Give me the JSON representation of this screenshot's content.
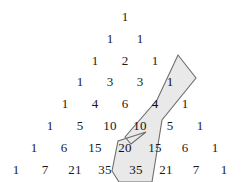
{
  "figure": {
    "colors": {
      "background": "#ffffff",
      "number": "#1a1a1a",
      "highlight_fill": "#e9e9e9",
      "highlight_stroke": "#6e6e6e"
    }
  },
  "chart_data": {
    "type": "table",
    "xlabel": "",
    "ylabel": "",
    "rows": [
      {
        "row_index": 0,
        "values": [
          1
        ]
      },
      {
        "row_index": 1,
        "values": [
          1,
          1
        ]
      },
      {
        "row_index": 2,
        "values": [
          1,
          2,
          1
        ]
      },
      {
        "row_index": 3,
        "values": [
          1,
          3,
          3,
          1
        ]
      },
      {
        "row_index": 4,
        "values": [
          1,
          4,
          6,
          4,
          1
        ]
      },
      {
        "row_index": 5,
        "values": [
          1,
          5,
          10,
          10,
          5,
          1
        ]
      },
      {
        "row_index": 6,
        "values": [
          1,
          6,
          15,
          20,
          15,
          6,
          1
        ]
      },
      {
        "row_index": 7,
        "values": [
          1,
          7,
          21,
          35,
          35,
          21,
          7,
          1
        ]
      }
    ],
    "highlighted_cells": [
      {
        "row": 3,
        "col": 3,
        "value": 1
      },
      {
        "row": 4,
        "col": 3,
        "value": 4
      },
      {
        "row": 5,
        "col": 3,
        "value": 10
      },
      {
        "row": 6,
        "col": 3,
        "value": 20
      },
      {
        "row": 7,
        "col": 4,
        "value": 35
      }
    ],
    "highlight_note": "1 + 4 + 10 + 20 = 35 (hockey stick identity)"
  },
  "cells": [
    {
      "text": "1",
      "x": 125,
      "y": 16,
      "highlighted": false,
      "row": 0,
      "col": 0
    },
    {
      "text": "1",
      "x": 110,
      "y": 38,
      "highlighted": false,
      "row": 1,
      "col": 0
    },
    {
      "text": "1",
      "x": 140,
      "y": 38,
      "highlighted": false,
      "row": 1,
      "col": 1
    },
    {
      "text": "1",
      "x": 95,
      "y": 60,
      "highlighted": false,
      "row": 2,
      "col": 0
    },
    {
      "text": "2",
      "x": 125,
      "y": 60,
      "highlighted": false,
      "row": 2,
      "col": 1
    },
    {
      "text": "1",
      "x": 155,
      "y": 60,
      "highlighted": false,
      "row": 2,
      "col": 2
    },
    {
      "text": "1",
      "x": 80,
      "y": 81,
      "highlighted": false,
      "row": 3,
      "col": 0
    },
    {
      "text": "3",
      "x": 110,
      "y": 81,
      "highlighted": false,
      "row": 3,
      "col": 1
    },
    {
      "text": "3",
      "x": 140,
      "y": 81,
      "highlighted": false,
      "row": 3,
      "col": 2
    },
    {
      "text": "1",
      "x": 170,
      "y": 81,
      "highlighted": true,
      "row": 3,
      "col": 3
    },
    {
      "text": "1",
      "x": 65,
      "y": 103,
      "highlighted": false,
      "row": 4,
      "col": 0
    },
    {
      "text": "4",
      "x": 95,
      "y": 103,
      "highlighted": false,
      "row": 4,
      "col": 1
    },
    {
      "text": "6",
      "x": 125,
      "y": 103,
      "highlighted": false,
      "row": 4,
      "col": 2
    },
    {
      "text": "4",
      "x": 155,
      "y": 103,
      "highlighted": true,
      "row": 4,
      "col": 3
    },
    {
      "text": "1",
      "x": 185,
      "y": 103,
      "highlighted": false,
      "row": 4,
      "col": 4
    },
    {
      "text": "1",
      "x": 50,
      "y": 125,
      "highlighted": false,
      "row": 5,
      "col": 0
    },
    {
      "text": "5",
      "x": 80,
      "y": 125,
      "highlighted": false,
      "row": 5,
      "col": 1
    },
    {
      "text": "10",
      "x": 110,
      "y": 125,
      "highlighted": false,
      "row": 5,
      "col": 2
    },
    {
      "text": "10",
      "x": 140,
      "y": 125,
      "highlighted": true,
      "row": 5,
      "col": 3
    },
    {
      "text": "5",
      "x": 170,
      "y": 125,
      "highlighted": false,
      "row": 5,
      "col": 4
    },
    {
      "text": "1",
      "x": 200,
      "y": 125,
      "highlighted": false,
      "row": 5,
      "col": 5
    },
    {
      "text": "1",
      "x": 34,
      "y": 147,
      "highlighted": false,
      "row": 6,
      "col": 0
    },
    {
      "text": "6",
      "x": 64,
      "y": 147,
      "highlighted": false,
      "row": 6,
      "col": 1
    },
    {
      "text": "15",
      "x": 95,
      "y": 147,
      "highlighted": false,
      "row": 6,
      "col": 2
    },
    {
      "text": "20",
      "x": 125,
      "y": 147,
      "highlighted": true,
      "row": 6,
      "col": 3
    },
    {
      "text": "15",
      "x": 155,
      "y": 147,
      "highlighted": false,
      "row": 6,
      "col": 4
    },
    {
      "text": "6",
      "x": 185,
      "y": 147,
      "highlighted": false,
      "row": 6,
      "col": 5
    },
    {
      "text": "1",
      "x": 215,
      "y": 147,
      "highlighted": false,
      "row": 6,
      "col": 6
    },
    {
      "text": "1",
      "x": 16,
      "y": 169,
      "highlighted": false,
      "row": 7,
      "col": 0
    },
    {
      "text": "7",
      "x": 45,
      "y": 169,
      "highlighted": false,
      "row": 7,
      "col": 1
    },
    {
      "text": "21",
      "x": 75,
      "y": 169,
      "highlighted": false,
      "row": 7,
      "col": 2
    },
    {
      "text": "35",
      "x": 105,
      "y": 169,
      "highlighted": false,
      "row": 7,
      "col": 3
    },
    {
      "text": "35",
      "x": 136,
      "y": 169,
      "highlighted": true,
      "row": 7,
      "col": 4
    },
    {
      "text": "21",
      "x": 166,
      "y": 169,
      "highlighted": false,
      "row": 7,
      "col": 5
    },
    {
      "text": "7",
      "x": 196,
      "y": 169,
      "highlighted": false,
      "row": 7,
      "col": 6
    },
    {
      "text": "1",
      "x": 224,
      "y": 169,
      "highlighted": false,
      "row": 7,
      "col": 7
    }
  ],
  "highlight_shape": {
    "points": "178,55 195,78 163,117 157,160 149,182 120,182 113,172 117,141 145,131 134,144 128,138 158,101",
    "path": "M 178 55 L 196 78 L 161 122 L 152 182 L 119 182 L 112 171 L 118 140 L 146 132 L 131 143 L 126 136 L 157 100 Z"
  }
}
